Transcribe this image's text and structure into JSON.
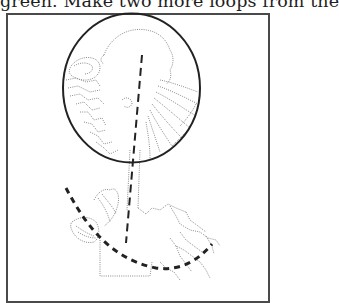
{
  "page": {
    "text_fragment": "green. Make two more loops from the"
  },
  "figure": {
    "type": "line-art illustration",
    "elements": {
      "focal_circle": {
        "stroke": "#222222",
        "style": "solid"
      },
      "vertical_guide": {
        "stroke": "#222222",
        "style": "dashed",
        "direction": "vertical, slightly tilted"
      },
      "curved_guide": {
        "stroke": "#222222",
        "style": "dashed",
        "direction": "arc across lower foliage"
      },
      "outline_drawing": {
        "stroke": "#8c8c8c",
        "style": "dotted"
      }
    },
    "frame_color": "#4a4a4a"
  }
}
